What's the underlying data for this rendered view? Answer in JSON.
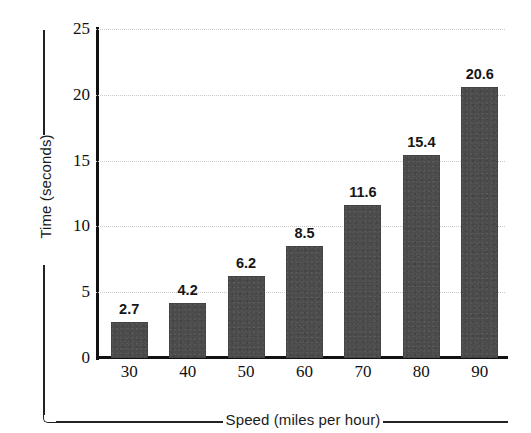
{
  "chart_data": {
    "type": "bar",
    "title": "",
    "subtitle": "",
    "xlabel": "Speed (miles per hour)",
    "ylabel": "Time (seconds)",
    "categories": [
      "30",
      "40",
      "50",
      "60",
      "70",
      "80",
      "90"
    ],
    "values": [
      2.7,
      4.2,
      6.2,
      8.5,
      11.6,
      15.4,
      20.6
    ],
    "value_labels": [
      "2.7",
      "4.2",
      "6.2",
      "8.5",
      "11.6",
      "15.4",
      "20.6"
    ],
    "ylim": [
      0,
      25
    ],
    "ytick_labels": [
      "0",
      "5",
      "10",
      "15",
      "20",
      "25"
    ],
    "ytick_values": [
      0,
      5,
      10,
      15,
      20,
      25
    ],
    "grid": "horizontal-dotted",
    "legend": "none",
    "bar_color": "#4b4b4b",
    "axis_color": "#111111",
    "grid_color": "#c9c9c9",
    "background_color": "#ffffff"
  }
}
